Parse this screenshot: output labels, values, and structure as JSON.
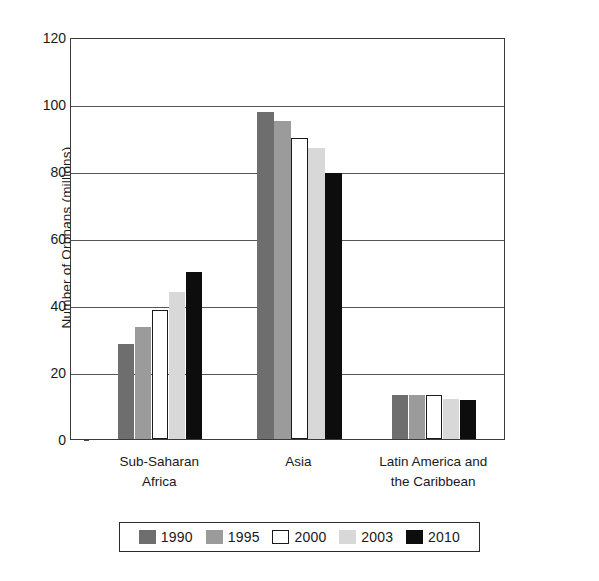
{
  "chart_data": {
    "type": "bar",
    "title": "",
    "xlabel": "",
    "ylabel": "Number of Orphans (millions)",
    "ylim": [
      0,
      120
    ],
    "ytick_labels": [
      "120",
      "100",
      "80",
      "60",
      "40",
      "20",
      "0"
    ],
    "ytick_values": [
      120,
      100,
      80,
      60,
      40,
      20,
      0
    ],
    "grid": true,
    "legend_position": "bottom",
    "categories": [
      "Sub-Saharan Africa",
      "Asia",
      "Latin America and the Caribbean"
    ],
    "category_lines": [
      [
        "Sub-Saharan",
        "Africa"
      ],
      [
        "Asia"
      ],
      [
        "Latin America and",
        "the Caribbean"
      ]
    ],
    "series": [
      {
        "name": "1990",
        "color": "#6e6e6e",
        "border": "#6e6e6e",
        "values": [
          28.5,
          97.5,
          13.2
        ]
      },
      {
        "name": "1995",
        "color": "#9b9b9b",
        "border": "#9b9b9b",
        "values": [
          33.5,
          95.0,
          13.2
        ]
      },
      {
        "name": "2000",
        "color": "#ffffff",
        "border": "#1a1a1a",
        "values": [
          38.5,
          90.0,
          13.0
        ]
      },
      {
        "name": "2003",
        "color": "#d8d8d8",
        "border": "#d8d8d8",
        "values": [
          44.0,
          87.0,
          12.0
        ]
      },
      {
        "name": "2010",
        "color": "#0d0d0d",
        "border": "#0d0d0d",
        "values": [
          50.0,
          79.5,
          11.5
        ]
      }
    ]
  }
}
